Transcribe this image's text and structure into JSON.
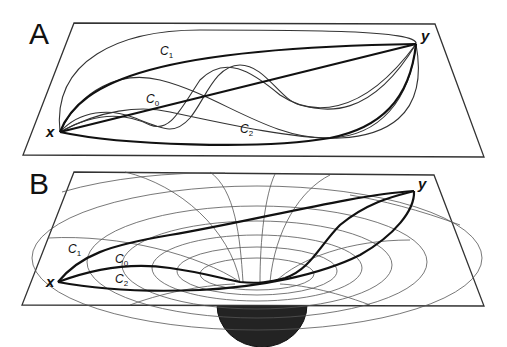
{
  "figure": {
    "panels": [
      {
        "id": "A",
        "label": "A",
        "description": "Flat plane with multiple paths between points x and y",
        "points": {
          "start": "x",
          "end": "y"
        },
        "curves": [
          {
            "name": "C",
            "sub": "0",
            "style": "straight line (thick)"
          },
          {
            "name": "C",
            "sub": "1",
            "style": "upper arc (thick)"
          },
          {
            "name": "C",
            "sub": "2",
            "style": "lower arc (thick)"
          }
        ],
        "extra_thin_paths": 5
      },
      {
        "id": "B",
        "label": "B",
        "description": "Curved space (gravity well) over a massive sphere with geodesics between x and y",
        "points": {
          "start": "x",
          "end": "y"
        },
        "curves": [
          {
            "name": "C",
            "sub": "1",
            "style": "upper path (thick)"
          },
          {
            "name": "C",
            "sub": "0",
            "style": "path through funnel (thick)"
          },
          {
            "name": "C",
            "sub": "2",
            "style": "lower path (thick)"
          }
        ],
        "mass_color": "#222222"
      }
    ]
  },
  "labels": {
    "panelA": "A",
    "panelB": "B",
    "xA": "x",
    "yA": "y",
    "xB": "x",
    "yB": "y",
    "c": "C",
    "s0": "0",
    "s1": "1",
    "s2": "2"
  }
}
